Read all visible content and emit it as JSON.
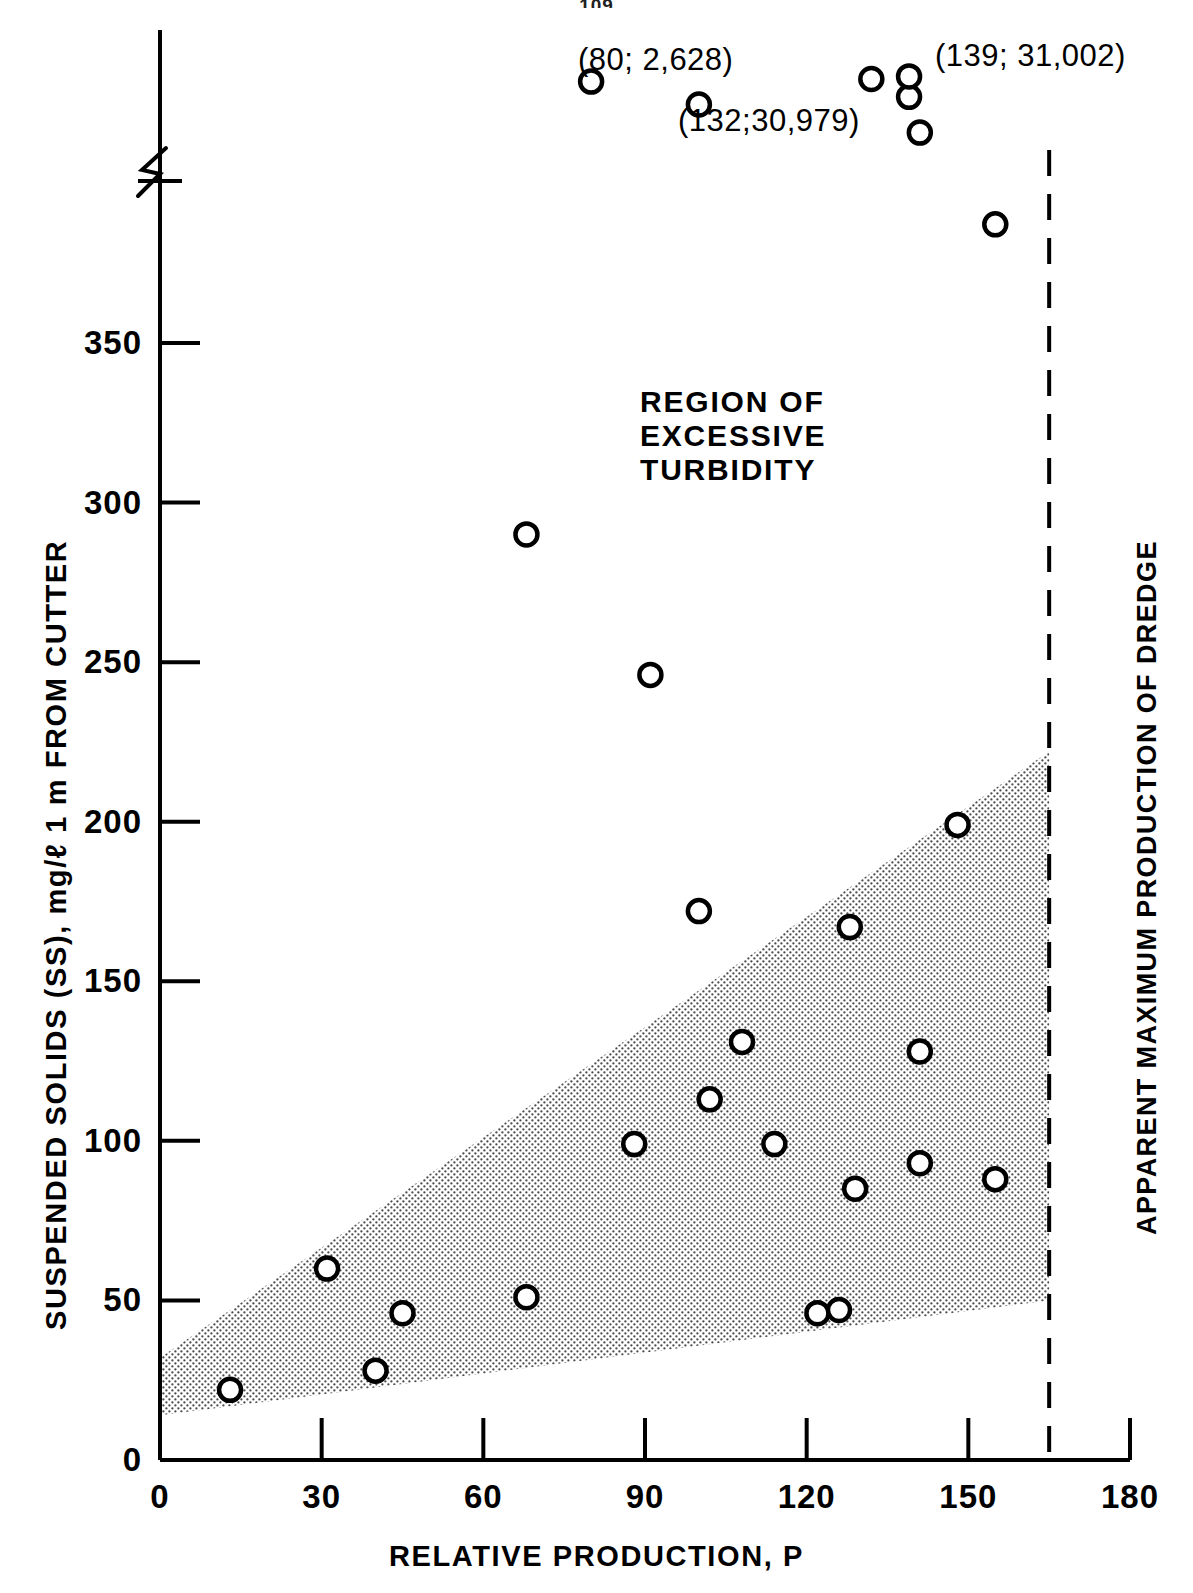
{
  "page": {
    "number": "109"
  },
  "chart_data": {
    "type": "scatter",
    "title": "",
    "xlabel": "RELATIVE PRODUCTION, P",
    "ylabel": "SUSPENDED SOLIDS (SS), mg/ℓ  1 m FROM CUTTER",
    "xlim": [
      0,
      180
    ],
    "ylim": [
      0,
      420
    ],
    "xticks": [
      0,
      30,
      60,
      90,
      120,
      150,
      180
    ],
    "yticks": [
      0,
      50,
      100,
      150,
      200,
      250,
      300,
      350
    ],
    "xticklabels": [
      "0",
      "30",
      "60",
      "90",
      "120",
      "150",
      "180"
    ],
    "yticklabels": [
      "0",
      "50",
      "100",
      "150",
      "200",
      "250",
      "300",
      "350"
    ],
    "grid": false,
    "legend": null,
    "axis_break": {
      "axis": "y",
      "at": 375,
      "note": "y-axis broken above 350"
    },
    "points": [
      {
        "x": 13,
        "y": 22
      },
      {
        "x": 31,
        "y": 60
      },
      {
        "x": 40,
        "y": 28
      },
      {
        "x": 45,
        "y": 46
      },
      {
        "x": 68,
        "y": 51
      },
      {
        "x": 68,
        "y": 290
      },
      {
        "x": 88,
        "y": 99
      },
      {
        "x": 91,
        "y": 246
      },
      {
        "x": 100,
        "y": 172
      },
      {
        "x": 102,
        "y": 113
      },
      {
        "x": 108,
        "y": 131
      },
      {
        "x": 114,
        "y": 99
      },
      {
        "x": 122,
        "y": 46
      },
      {
        "x": 126,
        "y": 47
      },
      {
        "x": 128,
        "y": 167
      },
      {
        "x": 129,
        "y": 85
      },
      {
        "x": 141,
        "y": 93
      },
      {
        "x": 141,
        "y": 128
      },
      {
        "x": 148,
        "y": 199
      },
      {
        "x": 155,
        "y": 88
      },
      {
        "x": 100,
        "y": 405
      },
      {
        "x": 139,
        "y": 408
      },
      {
        "x": 141,
        "y": 394
      },
      {
        "x": 155,
        "y": 358
      },
      {
        "x": 80,
        "y": 414
      },
      {
        "x": 132,
        "y": 415
      },
      {
        "x": 139,
        "y": 416
      }
    ],
    "annotations": [
      {
        "label": "(80; 2,628)",
        "x": 80,
        "y": 414
      },
      {
        "label": "(132;30,979)",
        "x": 132,
        "y": 415
      },
      {
        "label": "(139; 31,002)",
        "x": 139,
        "y": 416
      }
    ],
    "region_label": {
      "lines": [
        "REGION  OF",
        "EXCESSIVE",
        "TURBIDITY"
      ]
    },
    "vertical_line": {
      "label": "APPARENT MAXIMUM PRODUCTION OF DREDGE",
      "x": 165,
      "style": "dashed"
    },
    "shaded_band": {
      "description": "Stippled wedge of typical suspended-solids range",
      "upper_edge": [
        [
          0,
          32
        ],
        [
          165,
          222
        ]
      ],
      "lower_edge": [
        [
          0,
          14
        ],
        [
          165,
          50
        ]
      ]
    }
  }
}
